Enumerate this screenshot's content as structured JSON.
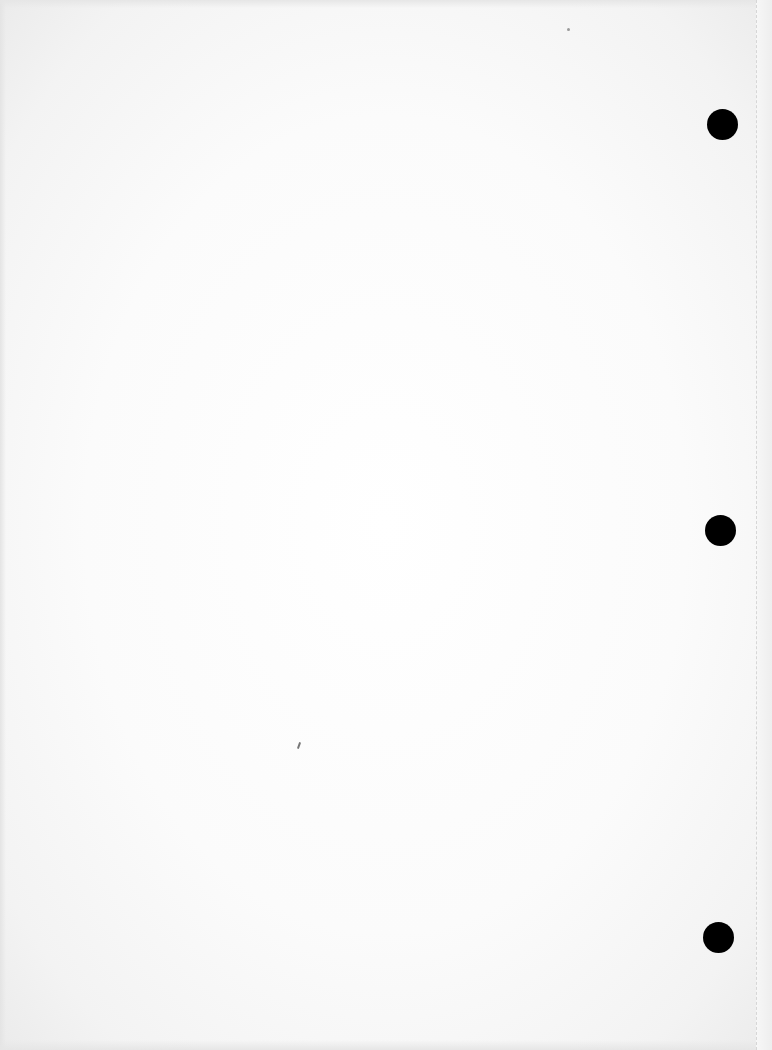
{
  "document": {
    "type": "blank-scanned-page",
    "text_content": "",
    "background_color": "#ffffff",
    "punch_holes": [
      {
        "cx": 722,
        "cy": 124,
        "diameter": 31,
        "color": "#000000"
      },
      {
        "cx": 720,
        "cy": 530,
        "diameter": 31,
        "color": "#000000"
      },
      {
        "cx": 718,
        "cy": 937,
        "diameter": 31,
        "color": "#000000"
      }
    ],
    "artifacts": [
      {
        "kind": "speck",
        "x": 567,
        "y": 28,
        "size": 3
      },
      {
        "kind": "pen-mark",
        "x": 298,
        "y": 742
      }
    ],
    "perforation_line_x": 756
  }
}
